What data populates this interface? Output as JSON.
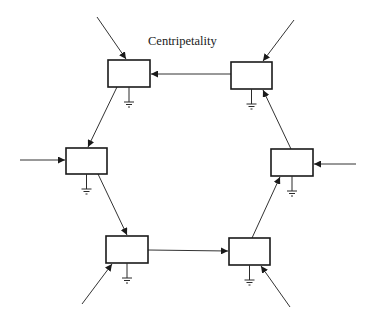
{
  "diagram": {
    "title": "Centripetality",
    "colors": {
      "stroke": "#1a1a1a",
      "background": "#ffffff"
    },
    "nodes": [
      {
        "id": "top-left",
        "x": 108,
        "y": 60,
        "w": 42,
        "h": 27,
        "ground": true
      },
      {
        "id": "top-right",
        "x": 231,
        "y": 62,
        "w": 41,
        "h": 27,
        "ground": true
      },
      {
        "id": "middle-left",
        "x": 66,
        "y": 148,
        "w": 41,
        "h": 26,
        "ground": true
      },
      {
        "id": "middle-right",
        "x": 271,
        "y": 149,
        "w": 42,
        "h": 27,
        "ground": true
      },
      {
        "id": "bottom-left",
        "x": 106,
        "y": 236,
        "w": 42,
        "h": 27,
        "ground": true
      },
      {
        "id": "bottom-right",
        "x": 229,
        "y": 238,
        "w": 41,
        "h": 27,
        "ground": true
      }
    ],
    "internal_edges": [
      {
        "from": "top-right",
        "to": "top-left",
        "x1": 231,
        "y1": 74,
        "x2": 151,
        "y2": 74
      },
      {
        "from": "top-left",
        "to": "middle-left",
        "x1": 117,
        "y1": 87,
        "x2": 88,
        "y2": 147
      },
      {
        "from": "middle-left",
        "to": "bottom-left",
        "x1": 98,
        "y1": 174,
        "x2": 127,
        "y2": 235
      },
      {
        "from": "bottom-left",
        "to": "bottom-right",
        "x1": 148,
        "y1": 250,
        "x2": 228,
        "y2": 251
      },
      {
        "from": "bottom-right",
        "to": "middle-right",
        "x1": 252,
        "y1": 238,
        "x2": 280,
        "y2": 177
      },
      {
        "from": "middle-right",
        "to": "top-right",
        "x1": 291,
        "y1": 149,
        "x2": 263,
        "y2": 90
      }
    ],
    "external_inputs": [
      {
        "to": "top-left",
        "x1": 97,
        "y1": 17,
        "x2": 126,
        "y2": 59
      },
      {
        "to": "top-right",
        "x1": 294,
        "y1": 20,
        "x2": 263,
        "y2": 61
      },
      {
        "to": "middle-left",
        "x1": 20,
        "y1": 160,
        "x2": 65,
        "y2": 160
      },
      {
        "to": "middle-right",
        "x1": 356,
        "y1": 164,
        "x2": 314,
        "y2": 164
      },
      {
        "to": "bottom-left",
        "x1": 82,
        "y1": 304,
        "x2": 112,
        "y2": 264
      },
      {
        "to": "bottom-right",
        "x1": 290,
        "y1": 307,
        "x2": 261,
        "y2": 266
      }
    ]
  }
}
